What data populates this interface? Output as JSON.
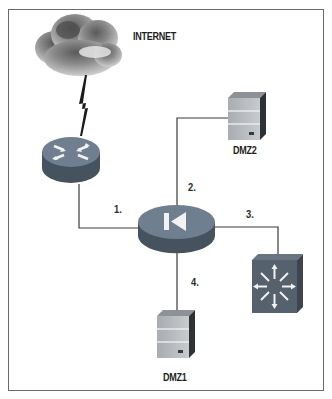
{
  "diagram": {
    "type": "network-topology",
    "nodes": [
      {
        "id": "internet",
        "label": "INTERNET",
        "kind": "cloud"
      },
      {
        "id": "router",
        "label": "",
        "kind": "router"
      },
      {
        "id": "firewall",
        "label": "",
        "kind": "firewall-router"
      },
      {
        "id": "dmz2",
        "label": "DMZ2",
        "kind": "server"
      },
      {
        "id": "dmz1",
        "label": "DMZ1",
        "kind": "server"
      },
      {
        "id": "switch",
        "label": "",
        "kind": "layer3-switch"
      }
    ],
    "links": [
      {
        "from": "internet",
        "to": "router",
        "label": "",
        "style": "lightning"
      },
      {
        "from": "router",
        "to": "firewall",
        "label": "1."
      },
      {
        "from": "firewall",
        "to": "dmz2",
        "label": "2."
      },
      {
        "from": "firewall",
        "to": "switch",
        "label": "3."
      },
      {
        "from": "firewall",
        "to": "dmz1",
        "label": "4."
      }
    ]
  },
  "labels": {
    "internet": "INTERNET",
    "dmz2": "DMZ2",
    "dmz1": "DMZ1",
    "link1": "1.",
    "link2": "2.",
    "link3": "3.",
    "link4": "4."
  },
  "colors": {
    "device_top": "#6f7f8f",
    "device_side": "#46525e",
    "server_face": "#b9bcc0",
    "line": "#3a3a3a",
    "frame": "#6a6a6a"
  }
}
